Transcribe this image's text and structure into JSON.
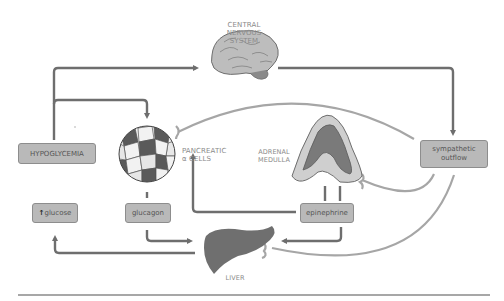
{
  "diagram": {
    "nodes": {
      "cns": {
        "label_lines": [
          "CENTRAL",
          "NERVOUS",
          "SYSTEM"
        ],
        "icon": "brain-icon"
      },
      "hypoglycemia": {
        "label": "HYPOGLYCEMIA"
      },
      "pancreas": {
        "label_lines": [
          "PANCREATIC",
          "α CELLS"
        ],
        "icon": "islet-cells-icon"
      },
      "adrenal": {
        "label_lines": [
          "ADRENAL",
          "MEDULLA"
        ],
        "icon": "adrenal-gland-icon"
      },
      "sympathetic": {
        "label_lines": [
          "sympathetic",
          "outflow"
        ]
      },
      "glucose": {
        "arrow_glyph": "↑",
        "label": "glucose"
      },
      "glucagon": {
        "label": "glucagon"
      },
      "epinephrine": {
        "label": "epinephrine"
      },
      "liver": {
        "label": "LIVER",
        "icon": "liver-icon"
      }
    },
    "edges": [
      {
        "from": "hypoglycemia",
        "to": "cns",
        "type": "arrow"
      },
      {
        "from": "hypoglycemia",
        "to": "pancreas",
        "type": "arrow"
      },
      {
        "from": "cns",
        "to": "sympathetic",
        "type": "arrow"
      },
      {
        "from": "sympathetic",
        "to": "pancreas",
        "type": "nerve-ending"
      },
      {
        "from": "sympathetic",
        "to": "adrenal",
        "type": "nerve-ending"
      },
      {
        "from": "sympathetic",
        "to": "liver",
        "type": "nerve-ending"
      },
      {
        "from": "pancreas",
        "to": "glucagon",
        "type": "line"
      },
      {
        "from": "adrenal",
        "to": "epinephrine",
        "type": "line"
      },
      {
        "from": "glucagon",
        "to": "liver",
        "type": "arrow"
      },
      {
        "from": "epinephrine",
        "to": "liver",
        "type": "arrow"
      },
      {
        "from": "epinephrine",
        "to": "pancreas",
        "type": "arrow"
      },
      {
        "from": "liver",
        "to": "glucose",
        "type": "arrow"
      }
    ],
    "colors": {
      "arrow": "#6e6e6e",
      "nerve": "#a6a6a6",
      "box_fill": "#b9b9b9",
      "box_border": "#8d8d8d",
      "organ_dark": "#6f6f6f",
      "organ_light": "#cfcfcf",
      "label_text": "#8a8a8a"
    }
  }
}
